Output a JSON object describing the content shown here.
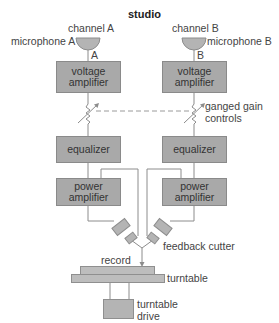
{
  "title": "studio",
  "channels": [
    {
      "channel_label": "channel A",
      "microphone_label": "microphone A",
      "line_label": "A"
    },
    {
      "channel_label": "channel B",
      "microphone_label": "microphone B",
      "line_label": "B"
    }
  ],
  "blocks": {
    "voltage_amplifier": [
      "voltage",
      "amplifier"
    ],
    "equalizer": "equalizer",
    "power_amplifier": [
      "power",
      "amplifier"
    ],
    "turntable_drive_label": [
      "turntable",
      "drive"
    ]
  },
  "labels": {
    "ganged_gain_controls": [
      "ganged gain",
      "controls"
    ],
    "feedback_cutter": "feedback cutter",
    "record": "record",
    "turntable": "turntable"
  },
  "colors": {
    "block_fill": "#a9a9a9",
    "microphone_fill": "#b4b4b4",
    "wire": "#8c8c8c",
    "text": "#444444"
  }
}
